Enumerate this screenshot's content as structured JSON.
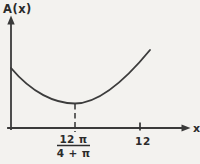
{
  "figure": {
    "ylabel": "A(x)",
    "xlabel": "x",
    "fraction_numerator": "12 π",
    "fraction_denominator": "4 + π",
    "tick_12_label": "12"
  },
  "colors": {
    "ink": "#2b2b2b",
    "line": "#3a3a3a",
    "background": "#f3f2ef"
  },
  "chart_data": {
    "type": "line",
    "title": "",
    "xlabel": "x",
    "ylabel": "A(x)",
    "x_tick_labels": [
      "12π/(4+π)",
      "12"
    ],
    "minimum": {
      "x_label": "12π/(4+π)",
      "x_approx": 5.28,
      "marker": "dashed vertical line from curve minimum to x-axis"
    },
    "shape": "Convex U-shaped curve: starts on the A(x)-axis, decreases to a minimum at x = 12π/(4+π), then increases toward upper right; unlabeled tick at x = 12",
    "grid": false,
    "legend": false,
    "curve_points_px": [
      [
        11,
        68
      ],
      [
        30,
        89
      ],
      [
        50,
        99
      ],
      [
        75,
        104
      ],
      [
        100,
        97
      ],
      [
        125,
        80
      ],
      [
        150,
        50
      ]
    ]
  },
  "paths": {
    "y_axis": "M 11 129 L 11 22",
    "y_axis_arrow": "M 11 15.5 L 7.3 24.5 L 14.7 24.5 Z",
    "x_axis": "M 8 128 L 183 128",
    "x_axis_arrow": "M 190.5 128 L 181.5 124.4 L 181.5 131.6 Z",
    "curve": "M 11 68 C 32 93, 55 103.5, 75 103.5 C 100 103.5, 127 78, 150 50",
    "min_dashed_line": "M 75 104 L 75 132",
    "tick_12": "M 140 122.5 L 140 130.5",
    "fraction_bar": "M 57 145.5 L 90 145.5"
  }
}
